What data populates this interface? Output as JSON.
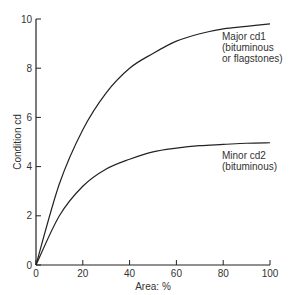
{
  "chart_data": {
    "type": "line",
    "title": "",
    "xlabel": "Area: %",
    "ylabel": "Condition cd",
    "xlim": [
      0,
      100
    ],
    "ylim": [
      0,
      10
    ],
    "x_ticks": [
      0,
      20,
      40,
      60,
      80,
      100
    ],
    "y_ticks": [
      0,
      2,
      4,
      6,
      8,
      10
    ],
    "grid": false,
    "legend": "none (inline annotations)",
    "x": [
      0,
      10,
      20,
      30,
      40,
      50,
      60,
      70,
      80,
      90,
      100
    ],
    "series": [
      {
        "name": "Major cd1 (bituminous or flagstones)",
        "values": [
          0,
          3.3,
          5.5,
          7.0,
          8.0,
          8.6,
          9.1,
          9.4,
          9.6,
          9.7,
          9.8
        ]
      },
      {
        "name": "Minor cd2 (bituminous)",
        "values": [
          0,
          2.0,
          3.2,
          3.9,
          4.3,
          4.6,
          4.75,
          4.85,
          4.9,
          4.95,
          4.97
        ]
      }
    ],
    "annotations": [
      {
        "lines": [
          "Major cd1",
          "(bituminous",
          "or flagstones)"
        ],
        "near_series": 0
      },
      {
        "lines": [
          "Minor cd2",
          "(bituminous)"
        ],
        "near_series": 1
      }
    ]
  },
  "labels": {
    "xlabel": "Area: %",
    "ylabel": "Condition cd",
    "major_line1": "Major cd1",
    "major_line2": "(bituminous",
    "major_line3": "or flagstones)",
    "minor_line1": "Minor cd2",
    "minor_line2": "(bituminous)"
  },
  "ticks": {
    "x": [
      "0",
      "20",
      "40",
      "60",
      "80",
      "100"
    ],
    "y": [
      "0",
      "2",
      "4",
      "6",
      "8",
      "10"
    ]
  }
}
